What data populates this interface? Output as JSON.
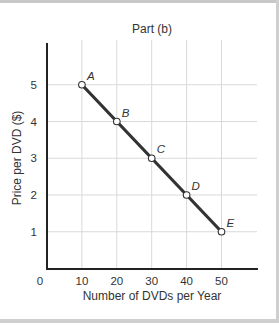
{
  "chart_data": {
    "type": "line",
    "title": "Part (b)",
    "xlabel": "Number of DVDs per Year",
    "ylabel": "Price per DVD ($)",
    "x_ticks": [
      "0",
      "10",
      "20",
      "30",
      "40",
      "50"
    ],
    "y_ticks": [
      "1",
      "2",
      "3",
      "4",
      "5"
    ],
    "xlim": [
      0,
      60
    ],
    "ylim": [
      0,
      6
    ],
    "grid": true,
    "legend": null,
    "series": [
      {
        "name": "Demand",
        "points": [
          {
            "label": "A",
            "x": 10,
            "y": 5
          },
          {
            "label": "B",
            "x": 20,
            "y": 4
          },
          {
            "label": "C",
            "x": 30,
            "y": 3
          },
          {
            "label": "D",
            "x": 40,
            "y": 2
          },
          {
            "label": "E",
            "x": 50,
            "y": 1
          }
        ]
      }
    ],
    "colors": {
      "line": "#333333",
      "grid": "#d9d9d9",
      "axis": "#222222",
      "marker_fill": "#ffffff"
    }
  }
}
